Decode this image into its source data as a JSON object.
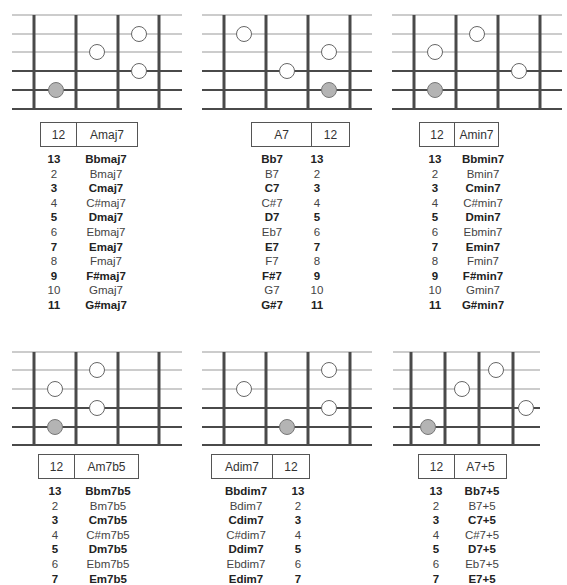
{
  "diagrams": [
    {
      "id": "amaj7",
      "label": {
        "fret": "12",
        "chord": "Amaj7",
        "order": "fret-first"
      },
      "frets_x": [
        34,
        76,
        118,
        159
      ],
      "strings_y": [
        15,
        34,
        52,
        71,
        90,
        109
      ],
      "line_x": [
        12,
        182
      ],
      "dots": [
        {
          "x": 139,
          "y": 34,
          "type": "open"
        },
        {
          "x": 97,
          "y": 52,
          "type": "open"
        },
        {
          "x": 139,
          "y": 71,
          "type": "open"
        },
        {
          "x": 56,
          "y": 90,
          "type": "root"
        }
      ],
      "list": [
        {
          "fret": "13",
          "chord": "Bbmaj7",
          "bold": true
        },
        {
          "fret": "2",
          "chord": "Bmaj7",
          "bold": false
        },
        {
          "fret": "3",
          "chord": "Cmaj7",
          "bold": true
        },
        {
          "fret": "4",
          "chord": "C#maj7",
          "bold": false
        },
        {
          "fret": "5",
          "chord": "Dmaj7",
          "bold": true
        },
        {
          "fret": "6",
          "chord": "Ebmaj7",
          "bold": false
        },
        {
          "fret": "7",
          "chord": "Emaj7",
          "bold": true
        },
        {
          "fret": "8",
          "chord": "Fmaj7",
          "bold": false
        },
        {
          "fret": "9",
          "chord": "F#maj7",
          "bold": true
        },
        {
          "fret": "10",
          "chord": "Gmaj7",
          "bold": false
        },
        {
          "fret": "11",
          "chord": "G#maj7",
          "bold": true
        }
      ]
    },
    {
      "id": "a7",
      "label": {
        "fret": "12",
        "chord": "A7",
        "order": "chord-first"
      },
      "frets_x": [
        224,
        266,
        308,
        350
      ],
      "strings_y": [
        15,
        34,
        52,
        71,
        90,
        109
      ],
      "line_x": [
        202,
        372
      ],
      "dots": [
        {
          "x": 244,
          "y": 34,
          "type": "open"
        },
        {
          "x": 329,
          "y": 52,
          "type": "open"
        },
        {
          "x": 287,
          "y": 71,
          "type": "open"
        },
        {
          "x": 329,
          "y": 90,
          "type": "root"
        }
      ],
      "list": [
        {
          "fret": "13",
          "chord": "Bb7",
          "bold": true
        },
        {
          "fret": "2",
          "chord": "B7",
          "bold": false
        },
        {
          "fret": "3",
          "chord": "C7",
          "bold": true
        },
        {
          "fret": "4",
          "chord": "C#7",
          "bold": false
        },
        {
          "fret": "5",
          "chord": "D7",
          "bold": true
        },
        {
          "fret": "6",
          "chord": "Eb7",
          "bold": false
        },
        {
          "fret": "7",
          "chord": "E7",
          "bold": true
        },
        {
          "fret": "8",
          "chord": "F7",
          "bold": false
        },
        {
          "fret": "9",
          "chord": "F#7",
          "bold": true
        },
        {
          "fret": "10",
          "chord": "G7",
          "bold": false
        },
        {
          "fret": "11",
          "chord": "G#7",
          "bold": true
        }
      ]
    },
    {
      "id": "amin7",
      "label": {
        "fret": "12",
        "chord": "Amin7",
        "order": "fret-first"
      },
      "frets_x": [
        414,
        456,
        498,
        540
      ],
      "strings_y": [
        15,
        34,
        52,
        71,
        90,
        109
      ],
      "line_x": [
        392,
        562
      ],
      "dots": [
        {
          "x": 477,
          "y": 34,
          "type": "open"
        },
        {
          "x": 435,
          "y": 52,
          "type": "open"
        },
        {
          "x": 519,
          "y": 71,
          "type": "open"
        },
        {
          "x": 435,
          "y": 90,
          "type": "root"
        }
      ],
      "list": [
        {
          "fret": "13",
          "chord": "Bbmin7",
          "bold": true
        },
        {
          "fret": "2",
          "chord": "Bmin7",
          "bold": false
        },
        {
          "fret": "3",
          "chord": "Cmin7",
          "bold": true
        },
        {
          "fret": "4",
          "chord": "C#min7",
          "bold": false
        },
        {
          "fret": "5",
          "chord": "Dmin7",
          "bold": true
        },
        {
          "fret": "6",
          "chord": "Ebmin7",
          "bold": false
        },
        {
          "fret": "7",
          "chord": "Emin7",
          "bold": true
        },
        {
          "fret": "8",
          "chord": "Fmin7",
          "bold": false
        },
        {
          "fret": "9",
          "chord": "F#min7",
          "bold": true
        },
        {
          "fret": "10",
          "chord": "Gmin7",
          "bold": false
        },
        {
          "fret": "11",
          "chord": "G#min7",
          "bold": true
        }
      ]
    },
    {
      "id": "am7b5",
      "label": {
        "fret": "12",
        "chord": "Am7b5",
        "order": "fret-first"
      },
      "frets_x": [
        34,
        76,
        118,
        159
      ],
      "strings_y": [
        352,
        370,
        389,
        408,
        427,
        445
      ],
      "line_x": [
        12,
        182
      ],
      "dots": [
        {
          "x": 97,
          "y": 370,
          "type": "open"
        },
        {
          "x": 55,
          "y": 389,
          "type": "open"
        },
        {
          "x": 97,
          "y": 408,
          "type": "open"
        },
        {
          "x": 55,
          "y": 427,
          "type": "root"
        }
      ],
      "list": [
        {
          "fret": "13",
          "chord": "Bbm7b5",
          "bold": true
        },
        {
          "fret": "2",
          "chord": "Bm7b5",
          "bold": false
        },
        {
          "fret": "3",
          "chord": "Cm7b5",
          "bold": true
        },
        {
          "fret": "4",
          "chord": "C#m7b5",
          "bold": false
        },
        {
          "fret": "5",
          "chord": "Dm7b5",
          "bold": true
        },
        {
          "fret": "6",
          "chord": "Ebm7b5",
          "bold": false
        },
        {
          "fret": "7",
          "chord": "Em7b5",
          "bold": true
        }
      ]
    },
    {
      "id": "adim7",
      "label": {
        "fret": "12",
        "chord": "Adim7",
        "order": "chord-first"
      },
      "frets_x": [
        224,
        266,
        308,
        350
      ],
      "strings_y": [
        352,
        370,
        389,
        408,
        427,
        445
      ],
      "line_x": [
        202,
        372
      ],
      "dots": [
        {
          "x": 329,
          "y": 370,
          "type": "open"
        },
        {
          "x": 244,
          "y": 389,
          "type": "open"
        },
        {
          "x": 329,
          "y": 408,
          "type": "open"
        },
        {
          "x": 287,
          "y": 427,
          "type": "root"
        }
      ],
      "list": [
        {
          "fret": "13",
          "chord": "Bbdim7",
          "bold": true
        },
        {
          "fret": "2",
          "chord": "Bdim7",
          "bold": false
        },
        {
          "fret": "3",
          "chord": "Cdim7",
          "bold": true
        },
        {
          "fret": "4",
          "chord": "C#dim7",
          "bold": false
        },
        {
          "fret": "5",
          "chord": "Ddim7",
          "bold": true
        },
        {
          "fret": "6",
          "chord": "Ebdim7",
          "bold": false
        },
        {
          "fret": "7",
          "chord": "Edim7",
          "bold": true
        }
      ]
    },
    {
      "id": "a7sharp5",
      "label": {
        "fret": "12",
        "chord": "A7+5",
        "order": "fret-first"
      },
      "frets_x": [
        411,
        445,
        479,
        513
      ],
      "strings_y": [
        352,
        370,
        389,
        408,
        427,
        445
      ],
      "line_x": [
        393,
        540
      ],
      "dots": [
        {
          "x": 496,
          "y": 370,
          "type": "open"
        },
        {
          "x": 462,
          "y": 389,
          "type": "open"
        },
        {
          "x": 526,
          "y": 408,
          "type": "open"
        },
        {
          "x": 428,
          "y": 427,
          "type": "root"
        }
      ],
      "list": [
        {
          "fret": "13",
          "chord": "Bb7+5",
          "bold": true
        },
        {
          "fret": "2",
          "chord": "B7+5",
          "bold": false
        },
        {
          "fret": "3",
          "chord": "C7+5",
          "bold": true
        },
        {
          "fret": "4",
          "chord": "C#7+5",
          "bold": false
        },
        {
          "fret": "5",
          "chord": "D7+5",
          "bold": true
        },
        {
          "fret": "6",
          "chord": "Eb7+5",
          "bold": false
        },
        {
          "fret": "7",
          "chord": "E7+5",
          "bold": true
        }
      ]
    }
  ],
  "colors": {
    "string_light": "#9a9a9a",
    "string_dark": "#4a4a4a",
    "fret": "#4a4a4a",
    "open_dot_fill": "#ffffff",
    "open_dot_stroke": "#666666",
    "root_dot_fill": "#b4b4b4",
    "root_dot_stroke": "#777777"
  }
}
